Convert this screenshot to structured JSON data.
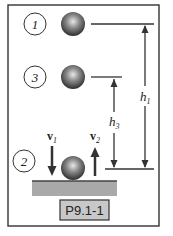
{
  "figure": {
    "label": "P9.1-1",
    "positions": [
      {
        "id": "1",
        "label": "1"
      },
      {
        "id": "3",
        "label": "3"
      },
      {
        "id": "2",
        "label": "2"
      }
    ],
    "heights": {
      "h1": {
        "symbol": "h",
        "subscript": "1"
      },
      "h3": {
        "symbol": "h",
        "subscript": "3"
      }
    },
    "velocities": {
      "v1": {
        "symbol": "v",
        "subscript": "1",
        "direction": "down"
      },
      "v2": {
        "symbol": "v",
        "subscript": "2",
        "direction": "up"
      }
    },
    "colors": {
      "ball": "#555555",
      "floor": "#a9a9a9",
      "label_bg": "#c8c8c8",
      "stroke": "#333333"
    }
  }
}
